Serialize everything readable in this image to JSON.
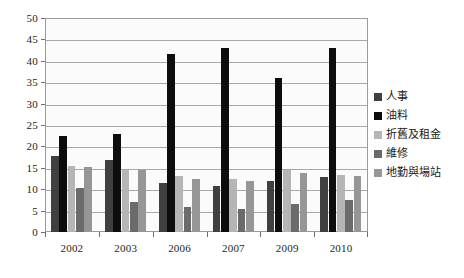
{
  "chart_data": {
    "type": "bar",
    "title": "",
    "subtitle": "",
    "xlabel": "",
    "ylabel": "",
    "categories": [
      "2002",
      "2003",
      "2006",
      "2007",
      "2009",
      "2010"
    ],
    "ylim": [
      0,
      50
    ],
    "ytick_step": 5,
    "yticks": [
      "0",
      "5",
      "10",
      "15",
      "20",
      "25",
      "30",
      "35",
      "40",
      "45",
      "50"
    ],
    "grid": true,
    "legend_position": "right",
    "series": [
      {
        "name": "人事",
        "color": "#404040",
        "values": [
          17.8,
          16.8,
          11.5,
          10.8,
          12.0,
          12.8
        ]
      },
      {
        "name": "油料",
        "color": "#0d0d0d",
        "values": [
          22.5,
          23.0,
          41.5,
          43.0,
          36.0,
          43.0
        ]
      },
      {
        "name": "折舊及租金",
        "color": "#b5b5b5",
        "values": [
          15.5,
          14.5,
          13.0,
          12.5,
          14.5,
          13.3
        ]
      },
      {
        "name": "維修",
        "color": "#6b6b6b",
        "values": [
          10.2,
          7.0,
          5.8,
          5.3,
          6.5,
          7.5
        ]
      },
      {
        "name": "地勤與場站",
        "color": "#969696",
        "values": [
          15.3,
          14.5,
          12.3,
          12.0,
          13.8,
          13.0
        ]
      }
    ]
  },
  "legend": {
    "items": [
      {
        "label": "人事"
      },
      {
        "label": "油料"
      },
      {
        "label": "折舊及租金"
      },
      {
        "label": "維修"
      },
      {
        "label": "地勤與場站"
      }
    ]
  },
  "colors": {
    "plot_background": "#fbfbfb",
    "gridline": "#a8a8a8",
    "axis_text": "#231f20",
    "border": "#9a9a9a"
  }
}
